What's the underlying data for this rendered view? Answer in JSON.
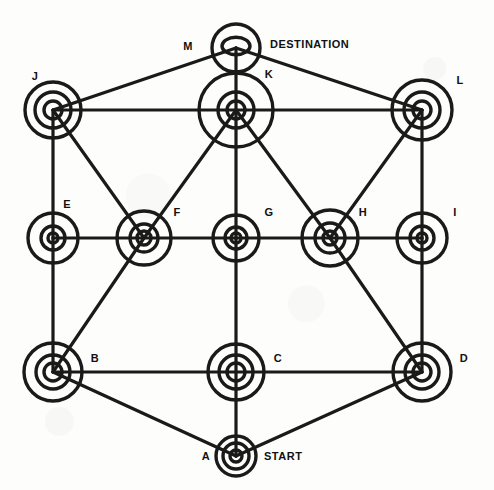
{
  "diagram": {
    "type": "undirected-graph",
    "background_color": "#fdfdfb",
    "stroke_color": "#1a1a1a",
    "annotations": {
      "start_label": "START",
      "destination_label": "DESTINATION"
    },
    "nodes": [
      {
        "id": "A",
        "label": "A",
        "x": 236,
        "y": 456,
        "rings": [
          20,
          13,
          6
        ],
        "label_dx": -30,
        "label_dy": 4,
        "annotation": "START",
        "anno_dx": 28,
        "anno_dy": 4
      },
      {
        "id": "B",
        "label": "B",
        "x": 53,
        "y": 372,
        "rings": [
          29,
          17,
          9
        ],
        "label_dx": 42,
        "label_dy": -10,
        "annotation": null,
        "anno_dx": 0,
        "anno_dy": 0
      },
      {
        "id": "C",
        "label": "C",
        "x": 236,
        "y": 372,
        "rings": [
          28,
          17,
          9
        ],
        "label_dx": 42,
        "label_dy": -10,
        "annotation": null,
        "anno_dx": 0,
        "anno_dy": 0
      },
      {
        "id": "D",
        "label": "D",
        "x": 422,
        "y": 372,
        "rings": [
          29,
          17,
          9
        ],
        "label_dx": 42,
        "label_dy": -10,
        "annotation": null,
        "anno_dx": 0,
        "anno_dy": 0
      },
      {
        "id": "E",
        "label": "E",
        "x": 53,
        "y": 238,
        "rings": [
          25,
          12,
          5
        ],
        "label_dx": 14,
        "label_dy": -30,
        "annotation": null,
        "anno_dx": 0,
        "anno_dy": 0
      },
      {
        "id": "F",
        "label": "F",
        "x": 144,
        "y": 238,
        "rings": [
          27,
          14,
          7
        ],
        "label_dx": 33,
        "label_dy": -22,
        "annotation": null,
        "anno_dx": 0,
        "anno_dy": 0
      },
      {
        "id": "G",
        "label": "G",
        "x": 236,
        "y": 238,
        "rings": [
          23,
          11,
          5
        ],
        "label_dx": 33,
        "label_dy": -22,
        "annotation": null,
        "anno_dx": 0,
        "anno_dy": 0
      },
      {
        "id": "H",
        "label": "H",
        "x": 330,
        "y": 238,
        "rings": [
          28,
          15,
          7
        ],
        "label_dx": 33,
        "label_dy": -22,
        "annotation": null,
        "anno_dx": 0,
        "anno_dy": 0
      },
      {
        "id": "I",
        "label": "I",
        "x": 422,
        "y": 238,
        "rings": [
          25,
          12,
          5
        ],
        "label_dx": 33,
        "label_dy": -22,
        "annotation": null,
        "anno_dx": 0,
        "anno_dy": 0
      },
      {
        "id": "J",
        "label": "J",
        "x": 53,
        "y": 110,
        "rings": [
          28,
          18,
          9
        ],
        "label_dx": -18,
        "label_dy": -30,
        "annotation": null,
        "anno_dx": 0,
        "anno_dy": 0
      },
      {
        "id": "K",
        "label": "K",
        "x": 236,
        "y": 110,
        "rings": [
          37,
          18,
          9
        ],
        "label_dx": 33,
        "label_dy": -32,
        "annotation": null,
        "anno_dx": 0,
        "anno_dy": 0
      },
      {
        "id": "L",
        "label": "L",
        "x": 422,
        "y": 110,
        "rings": [
          30,
          18,
          9
        ],
        "label_dx": 38,
        "label_dy": -26,
        "annotation": null,
        "anno_dx": 0,
        "anno_dy": 0
      },
      {
        "id": "M",
        "label": "M",
        "x": 236,
        "y": 48,
        "rings": [
          24,
          14,
          0
        ],
        "label_dx": -48,
        "label_dy": 2,
        "annotation": "DESTINATION",
        "anno_dx": 34,
        "anno_dy": 0
      }
    ],
    "edges": [
      {
        "from": "J",
        "to": "M"
      },
      {
        "from": "M",
        "to": "L"
      },
      {
        "from": "M",
        "to": "K"
      },
      {
        "from": "J",
        "to": "K"
      },
      {
        "from": "K",
        "to": "L"
      },
      {
        "from": "E",
        "to": "F"
      },
      {
        "from": "F",
        "to": "G"
      },
      {
        "from": "G",
        "to": "H"
      },
      {
        "from": "H",
        "to": "I"
      },
      {
        "from": "B",
        "to": "C"
      },
      {
        "from": "C",
        "to": "D"
      },
      {
        "from": "J",
        "to": "E"
      },
      {
        "from": "E",
        "to": "B"
      },
      {
        "from": "K",
        "to": "G"
      },
      {
        "from": "G",
        "to": "C"
      },
      {
        "from": "L",
        "to": "I"
      },
      {
        "from": "I",
        "to": "D"
      },
      {
        "from": "C",
        "to": "A"
      },
      {
        "from": "B",
        "to": "A"
      },
      {
        "from": "A",
        "to": "D"
      },
      {
        "from": "J",
        "to": "F"
      },
      {
        "from": "F",
        "to": "B"
      },
      {
        "from": "K",
        "to": "F"
      },
      {
        "from": "K",
        "to": "H"
      },
      {
        "from": "L",
        "to": "H"
      },
      {
        "from": "H",
        "to": "D"
      }
    ]
  }
}
